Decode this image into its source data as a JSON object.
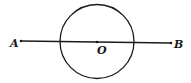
{
  "diagram": {
    "type": "geometry",
    "labels": {
      "point_a": "A",
      "point_b": "B",
      "center": "O"
    },
    "stroke_color": "#1a1a1a",
    "background": "#ffffff"
  }
}
